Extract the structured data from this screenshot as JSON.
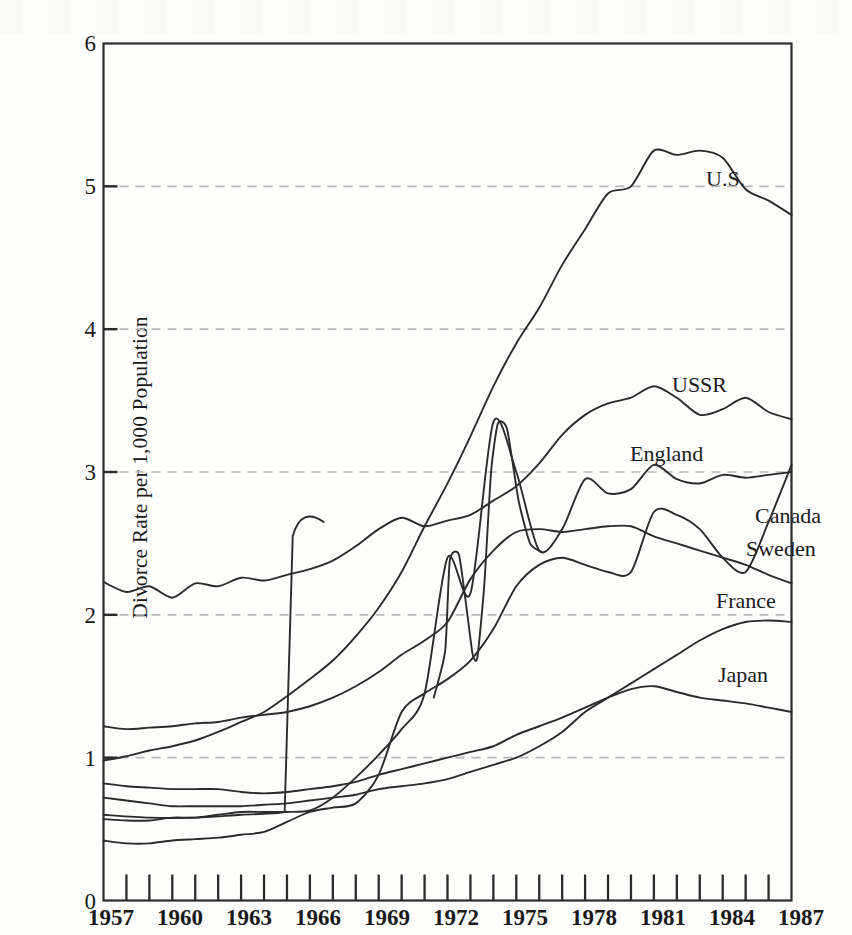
{
  "chart_data": {
    "type": "line",
    "title": "",
    "subtitle": "",
    "xlabel": "",
    "ylabel": "Divorce Rate per 1,000 Population",
    "xlim": [
      1957,
      1987
    ],
    "ylim": [
      0,
      6
    ],
    "grid": "horizontal dashed gridlines at 1,2,3,4,5",
    "legend_position": "inline labels at right end of each line",
    "y_ticks": [
      "0",
      "1",
      "2",
      "3",
      "4",
      "5",
      "6"
    ],
    "y_tick_values": [
      0,
      1,
      2,
      3,
      4,
      5,
      6
    ],
    "x_ticks": [
      "1957",
      "1960",
      "1963",
      "1966",
      "1969",
      "1972",
      "1975",
      "1978",
      "1981",
      "1984",
      "1987"
    ],
    "x_tick_values": [
      1957,
      1960,
      1963,
      1966,
      1969,
      1972,
      1975,
      1978,
      1981,
      1984,
      1987
    ],
    "x_minor_tick_interval": 1,
    "x": [
      1957,
      1958,
      1959,
      1960,
      1961,
      1962,
      1963,
      1964,
      1965,
      1966,
      1967,
      1968,
      1969,
      1970,
      1971,
      1972,
      1973,
      1974,
      1975,
      1976,
      1977,
      1978,
      1979,
      1980,
      1981,
      1982,
      1983,
      1984,
      1985,
      1986,
      1987
    ],
    "series": [
      {
        "name": "U.S.",
        "label": "U.S.",
        "values": [
          0.98,
          1.01,
          1.05,
          1.08,
          1.12,
          1.18,
          1.25,
          1.32,
          1.43,
          1.55,
          1.68,
          1.85,
          2.05,
          2.3,
          2.62,
          2.92,
          3.25,
          3.6,
          3.9,
          4.15,
          4.45,
          4.7,
          4.95,
          5.0,
          5.25,
          5.22,
          5.25,
          5.2,
          4.98,
          4.9,
          4.8
        ],
        "start_value": 0.98,
        "end_value": 4.8,
        "peak_value": 5.27,
        "peak_year": 1980
      },
      {
        "name": "USSR",
        "label": "USSR",
        "values": [
          2.23,
          2.16,
          2.2,
          2.12,
          2.22,
          2.2,
          2.26,
          2.24,
          2.28,
          2.32,
          2.38,
          2.48,
          2.6,
          2.68,
          2.62,
          2.66,
          2.7,
          2.8,
          2.9,
          3.06,
          3.26,
          3.4,
          3.48,
          3.52,
          3.6,
          3.52,
          3.4,
          3.44,
          3.52,
          3.42,
          3.37
        ],
        "start_value": 2.23,
        "end_value": 3.37,
        "peak_value": 3.6,
        "peak_year": 1981,
        "note": "second branch jumps sharply from ~0.6 to ~2.65 at 1965"
      },
      {
        "name": "England",
        "label": "England",
        "values": [
          0.57,
          0.56,
          0.56,
          0.58,
          0.58,
          0.6,
          0.62,
          0.62,
          0.62,
          0.63,
          0.72,
          0.86,
          1.02,
          1.2,
          1.45,
          2.4,
          2.15,
          3.35,
          3.0,
          2.45,
          2.6,
          2.95,
          2.85,
          2.88,
          3.05,
          2.95,
          2.92,
          2.98,
          2.96,
          2.98,
          3.0
        ],
        "start_value": 0.57,
        "end_value": 3.0,
        "peak_value": 3.35,
        "peak_year": 1974
      },
      {
        "name": "Canada",
        "label": "Canada",
        "values": [
          0.42,
          0.4,
          0.4,
          0.42,
          0.43,
          0.44,
          0.46,
          0.48,
          0.55,
          0.62,
          0.65,
          0.68,
          0.88,
          1.32,
          1.45,
          1.55,
          1.68,
          1.9,
          2.2,
          2.35,
          2.4,
          2.35,
          2.3,
          2.3,
          2.72,
          2.7,
          2.6,
          2.4,
          2.3,
          2.65,
          3.05
        ],
        "start_value": 0.42,
        "end_value": 3.05,
        "peak_value": 3.05,
        "peak_year": 1987
      },
      {
        "name": "Sweden",
        "label": "Sweden",
        "values": [
          1.22,
          1.2,
          1.21,
          1.22,
          1.24,
          1.25,
          1.28,
          1.3,
          1.32,
          1.36,
          1.42,
          1.5,
          1.6,
          1.72,
          1.82,
          1.95,
          2.25,
          2.45,
          2.58,
          2.6,
          2.58,
          2.6,
          2.62,
          2.62,
          2.55,
          2.5,
          2.45,
          2.4,
          2.35,
          2.28,
          2.22
        ],
        "start_value": 1.22,
        "end_value": 2.22,
        "peak_value": 2.62,
        "peak_year": 1979
      },
      {
        "name": "France",
        "label": "France",
        "values": [
          0.72,
          0.7,
          0.68,
          0.66,
          0.66,
          0.66,
          0.66,
          0.67,
          0.68,
          0.7,
          0.72,
          0.74,
          0.78,
          0.8,
          0.82,
          0.85,
          0.9,
          0.95,
          1.0,
          1.08,
          1.18,
          1.32,
          1.42,
          1.52,
          1.62,
          1.72,
          1.82,
          1.9,
          1.95,
          1.96,
          1.95
        ],
        "start_value": 0.72,
        "end_value": 1.95,
        "peak_value": 1.96,
        "peak_year": 1986
      },
      {
        "name": "Japan",
        "label": "Japan",
        "values": [
          0.82,
          0.8,
          0.79,
          0.78,
          0.78,
          0.78,
          0.76,
          0.75,
          0.76,
          0.78,
          0.8,
          0.83,
          0.88,
          0.92,
          0.96,
          1.0,
          1.04,
          1.08,
          1.16,
          1.22,
          1.28,
          1.35,
          1.42,
          1.48,
          1.5,
          1.46,
          1.42,
          1.4,
          1.38,
          1.35,
          1.32
        ],
        "start_value": 0.82,
        "end_value": 1.32,
        "peak_value": 1.51,
        "peak_year": 1981
      }
    ]
  },
  "axis": {
    "ylabel": "Divorce Rate per 1,000 Population",
    "y_ticks": [
      "0",
      "1",
      "2",
      "3",
      "4",
      "5",
      "6"
    ],
    "x_ticks": [
      "1957",
      "1960",
      "1963",
      "1966",
      "1969",
      "1972",
      "1975",
      "1978",
      "1981",
      "1984",
      "1987"
    ]
  },
  "labels": {
    "us": "U.S.",
    "ussr": "USSR",
    "england": "England",
    "canada": "Canada",
    "sweden": "Sweden",
    "france": "France",
    "japan": "Japan"
  },
  "colors": {
    "line": "#2b2b2b",
    "grid": "#b8b8b8",
    "axis": "#2b2b2b",
    "background": "#fdfdfc",
    "text": "#1a1a1a"
  }
}
